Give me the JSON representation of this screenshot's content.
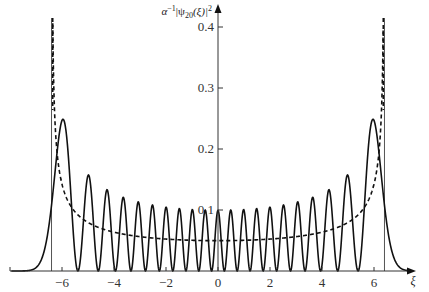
{
  "chart_data": {
    "type": "line",
    "title": "",
    "xlabel": "ξ",
    "ylabel": "α⁻¹|ψ₂₀(ξ)|²",
    "ylabel_parts": {
      "prefix": "α",
      "sup1": "−1",
      "mid": "|ψ",
      "sub": "20",
      "suffix": "(ξ)|",
      "sup2": "2"
    },
    "xlim": [
      -8,
      7.6
    ],
    "ylim": [
      0,
      0.42
    ],
    "x_ticks": [
      -6,
      -4,
      -2,
      0,
      2,
      4,
      6
    ],
    "x_tick_labels": [
      "−6",
      "−4",
      "−2",
      "0",
      "2",
      "4",
      "6"
    ],
    "y_ticks": [
      0.1,
      0.2,
      0.3,
      0.4
    ],
    "y_tick_labels": [
      "0.1",
      "0.2",
      "0.3",
      "0.4"
    ],
    "grid": false,
    "legend": null,
    "quantum_number": 20,
    "classical_turning_points": [
      -6.403,
      6.403
    ],
    "series": [
      {
        "name": "quantum probability density |ψ20(ξ)|²",
        "style": "solid",
        "peaks_approx": [
          {
            "x": -6.0,
            "y": 0.246
          },
          {
            "x": -5.1,
            "y": 0.155
          },
          {
            "x": -4.4,
            "y": 0.131
          },
          {
            "x": -3.8,
            "y": 0.118
          },
          {
            "x": -3.2,
            "y": 0.111
          },
          {
            "x": -2.6,
            "y": 0.106
          },
          {
            "x": -2.0,
            "y": 0.103
          },
          {
            "x": -1.5,
            "y": 0.101
          },
          {
            "x": -1.0,
            "y": 0.099
          },
          {
            "x": -0.5,
            "y": 0.099
          },
          {
            "x": 0.0,
            "y": 0.099
          },
          {
            "x": 0.5,
            "y": 0.099
          },
          {
            "x": 1.0,
            "y": 0.099
          },
          {
            "x": 1.5,
            "y": 0.101
          },
          {
            "x": 2.0,
            "y": 0.103
          },
          {
            "x": 2.6,
            "y": 0.106
          },
          {
            "x": 3.2,
            "y": 0.111
          },
          {
            "x": 3.8,
            "y": 0.118
          },
          {
            "x": 4.4,
            "y": 0.131
          },
          {
            "x": 5.1,
            "y": 0.155
          },
          {
            "x": 6.0,
            "y": 0.246
          }
        ]
      },
      {
        "name": "classical probability density 1/(π√(41−ξ²))",
        "style": "dashed",
        "min": {
          "x": 0,
          "y": 0.0497
        },
        "asymptotes": [
          -6.403,
          6.403
        ]
      }
    ]
  }
}
